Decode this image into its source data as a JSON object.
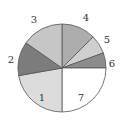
{
  "chart_data": {
    "type": "pie",
    "title": "",
    "center": [
      62,
      68
    ],
    "radius": 44,
    "start_angle_deg": 0,
    "direction": "clockwise",
    "slices": [
      {
        "label": "4",
        "angle": 45,
        "percent": 12.5,
        "color": "#adadad",
        "label_pos": [
          86,
          18
        ]
      },
      {
        "label": "5",
        "angle": 25,
        "percent": 6.9,
        "color": "#cfcfcf",
        "label_pos": [
          107,
          40
        ]
      },
      {
        "label": "6",
        "angle": 20,
        "percent": 5.6,
        "color": "#8c8c8c",
        "label_pos": [
          112,
          64
        ]
      },
      {
        "label": "7",
        "angle": 90,
        "percent": 25.0,
        "color": "#ffffff",
        "label_pos": [
          81,
          98
        ]
      },
      {
        "label": "1",
        "angle": 80,
        "percent": 22.2,
        "color": "#dcdcdc",
        "label_pos": [
          42,
          98
        ]
      },
      {
        "label": "2",
        "angle": 45,
        "percent": 12.5,
        "color": "#7c7c7c",
        "label_pos": [
          11,
          60
        ]
      },
      {
        "label": "3",
        "angle": 55,
        "percent": 15.3,
        "color": "#c6c6c6",
        "label_pos": [
          34,
          20
        ]
      }
    ],
    "legend": null
  }
}
